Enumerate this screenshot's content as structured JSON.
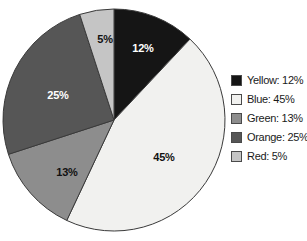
{
  "chart_data": {
    "type": "pie",
    "title": "",
    "labels": [
      "Yellow",
      "Blue",
      "Green",
      "Orange",
      "Red"
    ],
    "values": [
      12,
      45,
      13,
      25,
      5
    ],
    "value_unit": "%",
    "slice_labels": [
      "12%",
      "45%",
      "13%",
      "25%",
      "5%"
    ],
    "legend_entries": [
      "Yellow: 12%",
      "Blue: 45%",
      "Green: 13%",
      "Orange: 25%",
      "Red: 5%"
    ],
    "colors": [
      "#151515",
      "#f1f1ef",
      "#8d8d8d",
      "#565656",
      "#c5c5c5"
    ],
    "legend_position": "right",
    "start_angle_deg": 0,
    "direction": "clockwise",
    "grid": false,
    "xlabel": "",
    "ylabel": ""
  },
  "chart": {
    "geometry": {
      "cx": 114,
      "cy": 120,
      "r": 111,
      "outline_color": "#3a3a3a"
    },
    "slices": [
      {
        "name": "yellow",
        "label": "12%",
        "value": 12,
        "color": "#151515",
        "label_color": "light",
        "label_x": 143,
        "label_y": 52,
        "start_deg": 0,
        "end_deg": 43.2
      },
      {
        "name": "blue",
        "label": "45%",
        "value": 45,
        "color": "#f1f1ef",
        "label_color": "dark",
        "label_x": 164,
        "label_y": 161,
        "start_deg": 43.2,
        "end_deg": 205.2
      },
      {
        "name": "green",
        "label": "13%",
        "value": 13,
        "color": "#8d8d8d",
        "label_color": "dark",
        "label_x": 67,
        "label_y": 176,
        "start_deg": 205.2,
        "end_deg": 252.0
      },
      {
        "name": "orange",
        "label": "25%",
        "value": 25,
        "color": "#565656",
        "label_color": "light",
        "label_x": 58,
        "label_y": 99,
        "start_deg": 252.0,
        "end_deg": 342.0
      },
      {
        "name": "red",
        "label": "5%",
        "value": 5,
        "color": "#c5c5c5",
        "label_color": "dark",
        "label_x": 105,
        "label_y": 43,
        "start_deg": 342.0,
        "end_deg": 360.0
      }
    ]
  },
  "legend": {
    "items": [
      {
        "name": "yellow",
        "label": "Yellow: 12%",
        "color": "#151515"
      },
      {
        "name": "blue",
        "label": "Blue: 45%",
        "color": "#f1f1ef"
      },
      {
        "name": "green",
        "label": "Green: 13%",
        "color": "#8d8d8d"
      },
      {
        "name": "orange",
        "label": "Orange: 25%",
        "color": "#565656"
      },
      {
        "name": "red",
        "label": "Red: 5%",
        "color": "#c5c5c5"
      }
    ]
  }
}
